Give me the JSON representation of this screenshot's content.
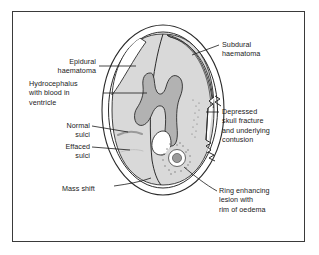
{
  "figure": {
    "type": "medical-diagram",
    "frame": {
      "border_color": "#3a3a3a",
      "background": "#ffffff"
    }
  },
  "colors": {
    "outline": "#2b2b2b",
    "brain_fill": "#d9d9d9",
    "ventricle_fill": "#b2b2b2",
    "haematoma_fill": "#ffffff",
    "lesion_core": "#9a9a9a",
    "sulcus_normal": "#9a9a9a",
    "sulcus_effaced": "#c0c0c0",
    "text": "#1b1b1b"
  },
  "labels": {
    "epidural_haematoma": "Epidural\nhaematoma",
    "hydrocephalus": "Hydrocephalus\nwith blood in\nventricle",
    "normal_sulci": "Normal\nsulci",
    "effaced_sulci": "Effaced\nsulci",
    "mass_shift": "Mass shift",
    "subdural_haematoma": "Subdural\nhaematoma",
    "depressed_fracture": "Depressed\nskull fracture\nand underlying\ncontusion",
    "ring_lesion": "Ring enhancing\nlesion with\nrim of oedema"
  },
  "structures": [
    {
      "name": "skull-outer-table",
      "description": "Outer oval skull contour"
    },
    {
      "name": "skull-inner-table",
      "description": "Inner oval skull contour"
    },
    {
      "name": "brain-parenchyma",
      "description": "Light grey brain tissue"
    },
    {
      "name": "lateral-ventricles",
      "description": "Dark grey butterfly shaped ventricles"
    },
    {
      "name": "intraventricular-blood",
      "description": "White blood within ventricle"
    },
    {
      "name": "falx-midline",
      "description": "Midline falx shifted to the left"
    },
    {
      "name": "epidural-haematoma",
      "description": "Biconvex white collection, left frontal"
    },
    {
      "name": "subdural-haematoma",
      "description": "Thin crescentic white collection, right"
    },
    {
      "name": "normal-sulcus",
      "description": "Preserved sulcus, left hemisphere"
    },
    {
      "name": "effaced-sulcus",
      "description": "Compressed faint sulcus, left hemisphere"
    },
    {
      "name": "depressed-skull-fracture",
      "description": "Inwardly displaced bone fragment, right"
    },
    {
      "name": "contusion",
      "description": "Stippled contusion beneath fracture"
    },
    {
      "name": "ring-enhancing-lesion",
      "description": "Ring lesion with stippled oedema rim"
    }
  ]
}
